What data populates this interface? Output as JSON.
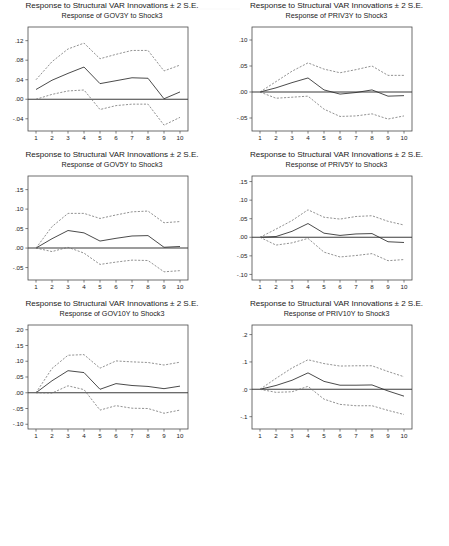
{
  "figure": {
    "supertitle": "Response to Structural VAR Innovations ± 2 S.E.",
    "shock_label": "Shock3",
    "xlabel": "",
    "periods": [
      1,
      2,
      3,
      4,
      5,
      6,
      7,
      8,
      9,
      10
    ]
  },
  "panels": [
    {
      "id": "gov3y",
      "supertitle": "Response to Structural VAR Innovations ± 2 S.E.",
      "subtitle": "Response of GOV3Y to Shock3",
      "variable": "GOV3Y",
      "yticks": [
        ".12",
        ".08",
        ".04",
        ".00",
        "-.04"
      ],
      "xticks": [
        "1",
        "2",
        "3",
        "4",
        "5",
        "6",
        "7",
        "8",
        "9",
        "10"
      ]
    },
    {
      "id": "priv3y",
      "supertitle": "Response to Structural VAR Innovations ± 2 S.E.",
      "subtitle": "Response of PRIV3Y to Shock3",
      "variable": "PRIV3Y",
      "yticks": [
        ".10",
        ".05",
        ".00",
        "-.05"
      ],
      "xticks": [
        "1",
        "2",
        "3",
        "4",
        "5",
        "6",
        "7",
        "8",
        "9",
        "10"
      ]
    },
    {
      "id": "gov5y",
      "supertitle": "Response to Structural VAR Innovations ± 2 S.E.",
      "subtitle": "Response of GOV5Y to Shock3",
      "variable": "GOV5Y",
      "yticks": [
        ".15",
        ".10",
        ".05",
        ".00",
        "-.05"
      ],
      "xticks": [
        "1",
        "2",
        "3",
        "4",
        "5",
        "6",
        "7",
        "8",
        "9",
        "10"
      ]
    },
    {
      "id": "priv5y",
      "supertitle": "Response to Structural VAR Innovations ± 2 S.E.",
      "subtitle": "Response of PRIV5Y to Shock3",
      "variable": "PRIV5Y",
      "yticks": [
        ".15",
        ".10",
        ".05",
        ".00",
        "-.05",
        "-.10"
      ],
      "xticks": [
        "1",
        "2",
        "3",
        "4",
        "5",
        "6",
        "7",
        "8",
        "9",
        "10"
      ]
    },
    {
      "id": "gov10y",
      "supertitle": "Response to Structural VAR Innovations ± 2 S.E.",
      "subtitle": "Response of GOV10Y to Shock3",
      "variable": "GOV10Y",
      "yticks": [
        ".20",
        ".15",
        ".10",
        ".05",
        ".00",
        "-.05",
        "-.10"
      ],
      "xticks": [
        "1",
        "2",
        "3",
        "4",
        "5",
        "6",
        "7",
        "8",
        "9",
        "10"
      ]
    },
    {
      "id": "priv10y",
      "supertitle": "Response to Structural VAR Innovations ± 2 S.E.",
      "subtitle": "Response of PRIV10Y to Shock3",
      "variable": "PRIV10Y",
      "yticks": [
        ".2",
        ".1",
        ".0",
        "-.1"
      ],
      "xticks": [
        "1",
        "2",
        "3",
        "4",
        "5",
        "6",
        "7",
        "8",
        "9",
        "10"
      ]
    }
  ],
  "chart_data": [
    {
      "type": "line",
      "id": "gov3y",
      "title": "Response of GOV3Y to Shock3",
      "supertitle": "Response to Structural VAR Innovations ± 2 S.E.",
      "xlabel": "",
      "ylabel": "",
      "x": [
        1,
        2,
        3,
        4,
        5,
        6,
        7,
        8,
        9,
        10
      ],
      "xlim": [
        0.5,
        10.5
      ],
      "ylim": [
        -0.065,
        0.148
      ],
      "ytick_values": [
        0.12,
        0.08,
        0.04,
        0.0,
        -0.04
      ],
      "ytick_labels": [
        ".12",
        ".08",
        ".04",
        ".00",
        "-.04"
      ],
      "grid": false,
      "legend": "none",
      "zero_line": true,
      "series": [
        {
          "name": "Response",
          "style": "solid",
          "values": [
            0.02,
            0.039,
            0.053,
            0.066,
            0.032,
            0.038,
            0.044,
            0.043,
            0.001,
            0.015
          ]
        },
        {
          "name": "Upper 2 S.E.",
          "style": "dashed",
          "values": [
            0.04,
            0.077,
            0.103,
            0.115,
            0.083,
            0.092,
            0.1,
            0.1,
            0.058,
            0.07
          ]
        },
        {
          "name": "Lower 2 S.E.",
          "style": "dashed",
          "values": [
            0.0,
            0.01,
            0.017,
            0.019,
            -0.021,
            -0.013,
            -0.01,
            -0.01,
            -0.053,
            -0.037
          ]
        }
      ]
    },
    {
      "type": "line",
      "id": "priv3y",
      "title": "Response of PRIV3Y to Shock3",
      "supertitle": "Response to Structural VAR Innovations ± 2 S.E.",
      "xlabel": "",
      "ylabel": "",
      "x": [
        1,
        2,
        3,
        4,
        5,
        6,
        7,
        8,
        9,
        10
      ],
      "xlim": [
        0.5,
        10.5
      ],
      "ylim": [
        -0.075,
        0.125
      ],
      "ytick_values": [
        0.1,
        0.05,
        0.0,
        -0.05
      ],
      "ytick_labels": [
        ".10",
        ".05",
        ".00",
        "-.05"
      ],
      "grid": false,
      "legend": "none",
      "zero_line": true,
      "series": [
        {
          "name": "Response",
          "style": "solid",
          "values": [
            0.0,
            0.008,
            0.018,
            0.027,
            0.004,
            -0.004,
            -0.001,
            0.004,
            -0.008,
            -0.007
          ]
        },
        {
          "name": "Upper 2 S.E.",
          "style": "dashed",
          "values": [
            0.0,
            0.02,
            0.04,
            0.056,
            0.044,
            0.037,
            0.043,
            0.05,
            0.032,
            0.032
          ]
        },
        {
          "name": "Lower 2 S.E.",
          "style": "dashed",
          "values": [
            0.0,
            -0.012,
            -0.01,
            -0.008,
            -0.033,
            -0.047,
            -0.046,
            -0.042,
            -0.052,
            -0.046
          ]
        }
      ]
    },
    {
      "type": "line",
      "id": "gov5y",
      "title": "Response of GOV5Y to Shock3",
      "supertitle": "Response to Structural VAR Innovations ± 2 S.E.",
      "xlabel": "",
      "ylabel": "",
      "x": [
        1,
        2,
        3,
        4,
        5,
        6,
        7,
        8,
        9,
        10
      ],
      "xlim": [
        0.5,
        10.5
      ],
      "ylim": [
        -0.082,
        0.185
      ],
      "ytick_values": [
        0.15,
        0.1,
        0.05,
        0.0,
        -0.05
      ],
      "ytick_labels": [
        ".15",
        ".10",
        ".05",
        ".00",
        "-.05"
      ],
      "grid": false,
      "legend": "none",
      "zero_line": true,
      "series": [
        {
          "name": "Response",
          "style": "solid",
          "values": [
            0.0,
            0.024,
            0.045,
            0.039,
            0.018,
            0.025,
            0.031,
            0.032,
            0.002,
            0.004
          ]
        },
        {
          "name": "Upper 2 S.E.",
          "style": "dashed",
          "values": [
            0.0,
            0.055,
            0.089,
            0.089,
            0.076,
            0.085,
            0.093,
            0.095,
            0.065,
            0.068
          ]
        },
        {
          "name": "Lower 2 S.E.",
          "style": "dashed",
          "values": [
            0.0,
            -0.009,
            0.002,
            -0.013,
            -0.042,
            -0.036,
            -0.031,
            -0.032,
            -0.061,
            -0.058
          ]
        }
      ]
    },
    {
      "type": "line",
      "id": "priv5y",
      "title": "Response of PRIV5Y to Shock3",
      "supertitle": "Response to Structural VAR Innovations ± 2 S.E.",
      "xlabel": "",
      "ylabel": "",
      "x": [
        1,
        2,
        3,
        4,
        5,
        6,
        7,
        8,
        9,
        10
      ],
      "xlim": [
        0.5,
        10.5
      ],
      "ylim": [
        -0.115,
        0.165
      ],
      "ytick_values": [
        0.15,
        0.1,
        0.05,
        0.0,
        -0.05,
        -0.1
      ],
      "ytick_labels": [
        ".15",
        ".10",
        ".05",
        ".00",
        "-.05",
        "-.10"
      ],
      "grid": false,
      "legend": "none",
      "zero_line": true,
      "series": [
        {
          "name": "Response",
          "style": "solid",
          "values": [
            0.0,
            0.002,
            0.016,
            0.037,
            0.011,
            0.005,
            0.009,
            0.01,
            -0.012,
            -0.014
          ]
        },
        {
          "name": "Upper 2 S.E.",
          "style": "dashed",
          "values": [
            0.0,
            0.022,
            0.045,
            0.074,
            0.054,
            0.049,
            0.056,
            0.058,
            0.043,
            0.033
          ]
        },
        {
          "name": "Lower 2 S.E.",
          "style": "dashed",
          "values": [
            0.0,
            -0.021,
            -0.015,
            -0.003,
            -0.04,
            -0.053,
            -0.049,
            -0.044,
            -0.063,
            -0.06
          ]
        }
      ]
    },
    {
      "type": "line",
      "id": "gov10y",
      "title": "Response of GOV10Y to Shock3",
      "supertitle": "Response to Structural VAR Innovations ± 2 S.E.",
      "xlabel": "",
      "ylabel": "",
      "x": [
        1,
        2,
        3,
        4,
        5,
        6,
        7,
        8,
        9,
        10
      ],
      "xlim": [
        0.5,
        10.5
      ],
      "ylim": [
        -0.115,
        0.215
      ],
      "ytick_values": [
        0.2,
        0.15,
        0.1,
        0.05,
        0.0,
        -0.05,
        -0.1
      ],
      "ytick_labels": [
        ".20",
        ".15",
        ".10",
        ".05",
        ".00",
        "-.05",
        "-.10"
      ],
      "grid": false,
      "legend": "none",
      "zero_line": true,
      "series": [
        {
          "name": "Response",
          "style": "solid",
          "values": [
            0.0,
            0.038,
            0.07,
            0.064,
            0.011,
            0.029,
            0.023,
            0.02,
            0.013,
            0.021
          ]
        },
        {
          "name": "Upper 2 S.E.",
          "style": "dashed",
          "values": [
            0.0,
            0.077,
            0.119,
            0.121,
            0.078,
            0.101,
            0.098,
            0.096,
            0.088,
            0.097
          ]
        },
        {
          "name": "Lower 2 S.E.",
          "style": "dashed",
          "values": [
            0.0,
            -0.001,
            0.022,
            0.01,
            -0.055,
            -0.041,
            -0.049,
            -0.05,
            -0.065,
            -0.055
          ]
        }
      ]
    },
    {
      "type": "line",
      "id": "priv10y",
      "title": "Response of PRIV10Y to Shock3",
      "supertitle": "Response to Structural VAR Innovations ± 2 S.E.",
      "xlabel": "",
      "ylabel": "",
      "x": [
        1,
        2,
        3,
        4,
        5,
        6,
        7,
        8,
        9,
        10
      ],
      "xlim": [
        0.5,
        10.5
      ],
      "ylim": [
        -0.145,
        0.235
      ],
      "ytick_values": [
        0.2,
        0.1,
        0.0,
        -0.1
      ],
      "ytick_labels": [
        ".2",
        ".1",
        ".0",
        "-.1"
      ],
      "grid": false,
      "legend": "none",
      "zero_line": true,
      "series": [
        {
          "name": "Response",
          "style": "solid",
          "values": [
            0.0,
            0.014,
            0.033,
            0.06,
            0.029,
            0.015,
            0.015,
            0.016,
            -0.006,
            -0.025
          ]
        },
        {
          "name": "Upper 2 S.E.",
          "style": "dashed",
          "values": [
            0.0,
            0.04,
            0.078,
            0.108,
            0.094,
            0.085,
            0.086,
            0.086,
            0.065,
            0.046
          ]
        },
        {
          "name": "Lower 2 S.E.",
          "style": "dashed",
          "values": [
            0.0,
            -0.011,
            -0.009,
            0.011,
            -0.036,
            -0.055,
            -0.06,
            -0.06,
            -0.077,
            -0.092
          ]
        }
      ]
    }
  ]
}
